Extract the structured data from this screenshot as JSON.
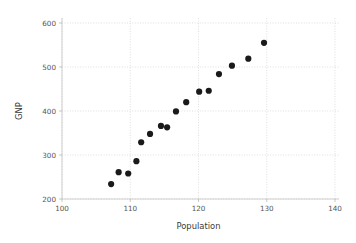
{
  "chart_data": {
    "type": "scatter",
    "title": "",
    "xlabel": "Population",
    "ylabel": "GNP",
    "xlim": [
      100,
      140
    ],
    "ylim": [
      200,
      620
    ],
    "grid": true,
    "legend": null,
    "xticks": [
      100,
      110,
      120,
      130,
      140
    ],
    "yticks": [
      200,
      300,
      400,
      500,
      600
    ],
    "xtick_labels": [
      "100",
      "110",
      "120",
      "130",
      "140"
    ],
    "ytick_labels": [
      "200",
      "300",
      "400",
      "500",
      "600"
    ],
    "marker": "circle",
    "marker_color": "#1a1a1a",
    "marker_size": 3.1,
    "points": [
      {
        "x": 107.2,
        "y": 234
      },
      {
        "x": 108.3,
        "y": 261
      },
      {
        "x": 109.7,
        "y": 258
      },
      {
        "x": 110.9,
        "y": 286
      },
      {
        "x": 111.6,
        "y": 329
      },
      {
        "x": 112.9,
        "y": 348
      },
      {
        "x": 114.5,
        "y": 366
      },
      {
        "x": 115.4,
        "y": 363
      },
      {
        "x": 116.7,
        "y": 399
      },
      {
        "x": 118.2,
        "y": 420
      },
      {
        "x": 120.1,
        "y": 444
      },
      {
        "x": 121.5,
        "y": 446
      },
      {
        "x": 123.0,
        "y": 484
      },
      {
        "x": 124.9,
        "y": 503
      },
      {
        "x": 127.3,
        "y": 519
      },
      {
        "x": 129.6,
        "y": 555
      }
    ],
    "x": [
      107.2,
      108.3,
      109.7,
      110.9,
      111.6,
      112.9,
      114.5,
      115.4,
      116.7,
      118.2,
      120.1,
      121.5,
      123.0,
      124.9,
      127.3,
      129.6
    ],
    "values": [
      234,
      261,
      258,
      286,
      329,
      348,
      366,
      363,
      399,
      420,
      444,
      446,
      484,
      503,
      519,
      555
    ]
  },
  "figure": {
    "background_color": "#ffffff",
    "grid_color": "#c9c9c9",
    "axis_color": "#bdbdbd",
    "tick_text_color": "#555555",
    "label_text_color": "#3a3a3a"
  }
}
